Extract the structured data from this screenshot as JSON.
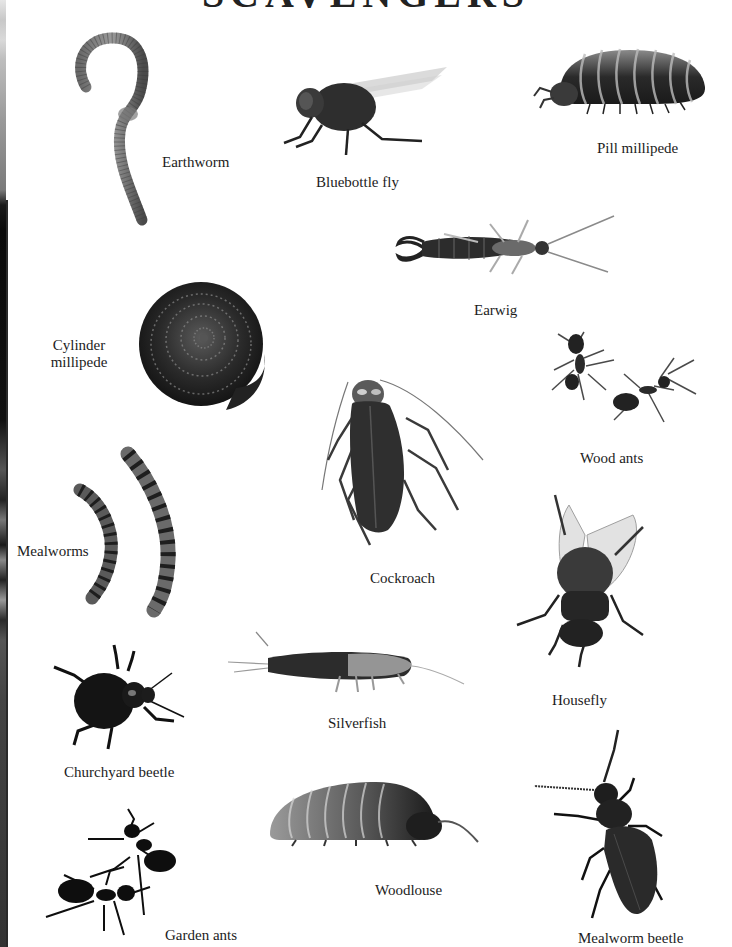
{
  "page": {
    "title": "SCAVENGERS",
    "title_visible": "partially cropped at top edge",
    "background": "#ffffff",
    "text_color": "#1c1c1c"
  },
  "creatures": [
    {
      "id": "earthworm",
      "label": "Earthworm"
    },
    {
      "id": "bluebottle-fly",
      "label": "Bluebottle fly"
    },
    {
      "id": "pill-millipede",
      "label": "Pill millipede"
    },
    {
      "id": "earwig",
      "label": "Earwig"
    },
    {
      "id": "cylinder-millipede",
      "label": "Cylinder millipede",
      "label_lines": [
        "Cylinder",
        "millipede"
      ]
    },
    {
      "id": "cockroach",
      "label": "Cockroach"
    },
    {
      "id": "wood-ants",
      "label": "Wood ants"
    },
    {
      "id": "mealworms",
      "label": "Mealworms"
    },
    {
      "id": "housefly",
      "label": "Housefly"
    },
    {
      "id": "churchyard-beetle",
      "label": "Churchyard beetle"
    },
    {
      "id": "silverfish",
      "label": "Silverfish"
    },
    {
      "id": "woodlouse",
      "label": "Woodlouse"
    },
    {
      "id": "garden-ants",
      "label": "Garden ants"
    },
    {
      "id": "mealworm-beetle",
      "label": "Mealworm beetle"
    }
  ]
}
